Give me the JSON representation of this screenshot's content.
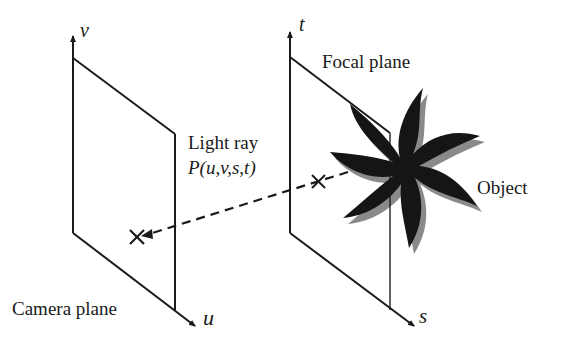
{
  "diagram": {
    "colors": {
      "line": "#1a1a1a",
      "object": "#151515",
      "object_shadow": "#8a8a8a",
      "background": "#ffffff"
    },
    "camera_plane": {
      "label": "Camera plane",
      "axis_vertical": "v",
      "axis_horizontal": "u"
    },
    "focal_plane": {
      "label": "Focal plane",
      "axis_vertical": "t",
      "axis_horizontal": "s"
    },
    "light_ray": {
      "label": "Light ray",
      "formula": "P(u,v,s,t)",
      "style": "dashed"
    },
    "object": {
      "label": "Object",
      "shape": "star-flower"
    },
    "markers": [
      {
        "name": "camera-plane-intersection",
        "glyph": "x"
      },
      {
        "name": "focal-plane-intersection",
        "glyph": "x"
      }
    ]
  }
}
